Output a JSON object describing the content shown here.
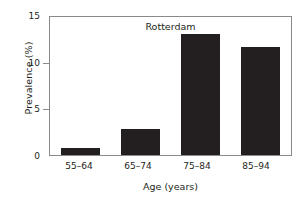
{
  "chart_data": {
    "type": "bar",
    "title": "Rotterdam",
    "xlabel": "Age (years)",
    "ylabel": "Prevalence (%)",
    "categories": [
      "55–64",
      "65–74",
      "75–84",
      "85–94"
    ],
    "values": [
      0.8,
      2.8,
      13.1,
      11.7
    ],
    "ylim": [
      0,
      15
    ],
    "yticks": [
      0,
      5,
      10,
      15
    ],
    "ytick_labels": [
      "0",
      "5",
      "10",
      "15"
    ],
    "grid": false,
    "legend": null,
    "bar_color": "#231f20",
    "axis_color": "#8a8a8a",
    "text_color": "#231f20",
    "background": "#ffffff"
  }
}
